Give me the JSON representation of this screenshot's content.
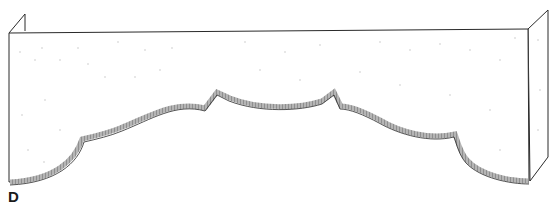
{
  "figure": {
    "label": "D",
    "colors": {
      "line": "#2a2a2a",
      "board_fill": "#ffffff",
      "edge_band": "#9a9a9a",
      "speckle": "#c8c8c8"
    }
  }
}
